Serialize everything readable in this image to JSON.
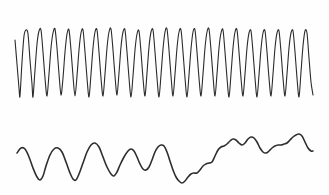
{
  "figure": {
    "title": "",
    "background_color": "#fefefe",
    "width": 329,
    "height": 195
  },
  "chart_data": {
    "type": "line",
    "title": "",
    "subtitle": "",
    "xlabel": "",
    "ylabel": "",
    "xlim": [
      0,
      329
    ],
    "ylim": [
      0,
      195
    ],
    "grid": false,
    "legend": "none",
    "axes_visible": false,
    "tick_labels_x": [],
    "tick_labels_y": [],
    "annotations": [],
    "series": [
      {
        "name": "upper-trace",
        "style": "high-frequency-oscillation",
        "stroke_color": "#2b2b2b",
        "stroke_width": 1.1,
        "cycles": 20,
        "x_start": 15,
        "x_end": 313,
        "peak_y": 29,
        "trough_y": 98,
        "amplitude": 34.5,
        "points": [
          [
            15,
            40
          ],
          [
            17,
            64
          ],
          [
            19,
            88
          ],
          [
            20,
            96
          ],
          [
            22,
            62
          ],
          [
            24,
            36
          ],
          [
            26,
            30
          ],
          [
            28,
            34
          ],
          [
            30,
            60
          ],
          [
            32,
            84
          ],
          [
            33,
            97
          ],
          [
            35,
            70
          ],
          [
            37,
            44
          ],
          [
            39,
            31
          ],
          [
            41,
            30
          ],
          [
            43,
            52
          ],
          [
            45,
            78
          ],
          [
            47,
            96
          ],
          [
            49,
            74
          ],
          [
            51,
            48
          ],
          [
            53,
            33
          ],
          [
            55,
            29
          ],
          [
            57,
            48
          ],
          [
            59,
            74
          ],
          [
            61,
            95
          ],
          [
            63,
            78
          ],
          [
            65,
            52
          ],
          [
            67,
            34
          ],
          [
            69,
            30
          ],
          [
            71,
            50
          ],
          [
            73,
            76
          ],
          [
            75,
            96
          ],
          [
            77,
            76
          ],
          [
            79,
            50
          ],
          [
            81,
            33
          ],
          [
            83,
            30
          ],
          [
            85,
            52
          ],
          [
            87,
            78
          ],
          [
            89,
            97
          ],
          [
            91,
            74
          ],
          [
            93,
            48
          ],
          [
            95,
            32
          ],
          [
            97,
            30
          ],
          [
            99,
            52
          ],
          [
            101,
            78
          ],
          [
            103,
            96
          ],
          [
            105,
            74
          ],
          [
            107,
            48
          ],
          [
            109,
            32
          ],
          [
            111,
            29
          ],
          [
            113,
            50
          ],
          [
            115,
            76
          ],
          [
            117,
            95
          ],
          [
            119,
            73
          ],
          [
            121,
            47
          ],
          [
            123,
            32
          ],
          [
            125,
            30
          ],
          [
            127,
            52
          ],
          [
            129,
            78
          ],
          [
            131,
            97
          ],
          [
            133,
            76
          ],
          [
            135,
            50
          ],
          [
            137,
            34
          ],
          [
            139,
            31
          ],
          [
            141,
            52
          ],
          [
            143,
            78
          ],
          [
            145,
            96
          ],
          [
            147,
            73
          ],
          [
            149,
            47
          ],
          [
            151,
            32
          ],
          [
            153,
            30
          ],
          [
            155,
            52
          ],
          [
            157,
            78
          ],
          [
            159,
            97
          ],
          [
            161,
            75
          ],
          [
            163,
            49
          ],
          [
            165,
            32
          ],
          [
            167,
            29
          ],
          [
            169,
            50
          ],
          [
            171,
            76
          ],
          [
            173,
            96
          ],
          [
            175,
            74
          ],
          [
            177,
            48
          ],
          [
            179,
            32
          ],
          [
            181,
            30
          ],
          [
            183,
            52
          ],
          [
            185,
            78
          ],
          [
            187,
            97
          ],
          [
            189,
            75
          ],
          [
            191,
            49
          ],
          [
            193,
            32
          ],
          [
            195,
            30
          ],
          [
            197,
            52
          ],
          [
            199,
            78
          ],
          [
            201,
            96
          ],
          [
            203,
            74
          ],
          [
            205,
            48
          ],
          [
            207,
            32
          ],
          [
            209,
            29
          ],
          [
            211,
            50
          ],
          [
            213,
            76
          ],
          [
            215,
            96
          ],
          [
            217,
            74
          ],
          [
            219,
            48
          ],
          [
            221,
            33
          ],
          [
            223,
            30
          ],
          [
            225,
            52
          ],
          [
            227,
            78
          ],
          [
            229,
            97
          ],
          [
            231,
            74
          ],
          [
            233,
            48
          ],
          [
            235,
            32
          ],
          [
            237,
            30
          ],
          [
            239,
            52
          ],
          [
            241,
            78
          ],
          [
            243,
            96
          ],
          [
            245,
            74
          ],
          [
            247,
            48
          ],
          [
            249,
            33
          ],
          [
            251,
            31
          ],
          [
            253,
            52
          ],
          [
            255,
            78
          ],
          [
            257,
            97
          ],
          [
            259,
            75
          ],
          [
            261,
            49
          ],
          [
            263,
            33
          ],
          [
            265,
            31
          ],
          [
            267,
            52
          ],
          [
            269,
            78
          ],
          [
            271,
            96
          ],
          [
            273,
            74
          ],
          [
            275,
            48
          ],
          [
            277,
            33
          ],
          [
            279,
            31
          ],
          [
            281,
            52
          ],
          [
            283,
            78
          ],
          [
            285,
            96
          ],
          [
            287,
            74
          ],
          [
            289,
            48
          ],
          [
            291,
            33
          ],
          [
            293,
            31
          ],
          [
            295,
            52
          ],
          [
            297,
            78
          ],
          [
            299,
            97
          ],
          [
            301,
            72
          ],
          [
            303,
            46
          ],
          [
            305,
            31
          ],
          [
            307,
            33
          ],
          [
            309,
            58
          ],
          [
            311,
            82
          ],
          [
            313,
            95
          ]
        ]
      },
      {
        "name": "lower-trace",
        "style": "low-frequency-irregular-wave",
        "stroke_color": "#2e2e2e",
        "stroke_width": 1.6,
        "x_start": 17,
        "x_end": 313,
        "max_y": 136,
        "min_y": 183,
        "points": [
          [
            17,
            153
          ],
          [
            21,
            148
          ],
          [
            25,
            149
          ],
          [
            29,
            157
          ],
          [
            33,
            168
          ],
          [
            37,
            177
          ],
          [
            40,
            180
          ],
          [
            43,
            176
          ],
          [
            46,
            166
          ],
          [
            50,
            155
          ],
          [
            54,
            149
          ],
          [
            58,
            148
          ],
          [
            62,
            152
          ],
          [
            66,
            162
          ],
          [
            70,
            173
          ],
          [
            73,
            179
          ],
          [
            76,
            180
          ],
          [
            79,
            174
          ],
          [
            83,
            163
          ],
          [
            87,
            152
          ],
          [
            91,
            145
          ],
          [
            95,
            143
          ],
          [
            99,
            147
          ],
          [
            103,
            157
          ],
          [
            107,
            167
          ],
          [
            111,
            174
          ],
          [
            114,
            176
          ],
          [
            117,
            172
          ],
          [
            120,
            165
          ],
          [
            124,
            157
          ],
          [
            128,
            151
          ],
          [
            131,
            149
          ],
          [
            134,
            151
          ],
          [
            137,
            157
          ],
          [
            140,
            164
          ],
          [
            143,
            169
          ],
          [
            146,
            170
          ],
          [
            149,
            167
          ],
          [
            152,
            160
          ],
          [
            155,
            152
          ],
          [
            158,
            147
          ],
          [
            161,
            145
          ],
          [
            164,
            146
          ],
          [
            167,
            152
          ],
          [
            170,
            161
          ],
          [
            173,
            170
          ],
          [
            176,
            177
          ],
          [
            179,
            181
          ],
          [
            182,
            183
          ],
          [
            185,
            181
          ],
          [
            188,
            177
          ],
          [
            191,
            174
          ],
          [
            194,
            173
          ],
          [
            197,
            173
          ],
          [
            200,
            170
          ],
          [
            203,
            166
          ],
          [
            206,
            164
          ],
          [
            209,
            163
          ],
          [
            212,
            162
          ],
          [
            215,
            156
          ],
          [
            218,
            150
          ],
          [
            221,
            147
          ],
          [
            224,
            146
          ],
          [
            227,
            144
          ],
          [
            230,
            141
          ],
          [
            233,
            139
          ],
          [
            236,
            140
          ],
          [
            239,
            143
          ],
          [
            242,
            145
          ],
          [
            245,
            143
          ],
          [
            248,
            139
          ],
          [
            251,
            137
          ],
          [
            254,
            138
          ],
          [
            257,
            142
          ],
          [
            260,
            148
          ],
          [
            263,
            152
          ],
          [
            266,
            153
          ],
          [
            269,
            151
          ],
          [
            272,
            148
          ],
          [
            275,
            146
          ],
          [
            278,
            145
          ],
          [
            281,
            145
          ],
          [
            284,
            144
          ],
          [
            287,
            143
          ],
          [
            290,
            140
          ],
          [
            293,
            137
          ],
          [
            296,
            135
          ],
          [
            299,
            134
          ],
          [
            302,
            136
          ],
          [
            305,
            142
          ],
          [
            308,
            148
          ],
          [
            311,
            151
          ],
          [
            313,
            151
          ]
        ]
      }
    ]
  }
}
